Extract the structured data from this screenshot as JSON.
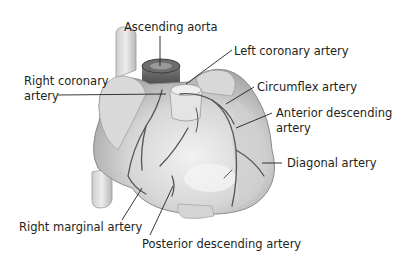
{
  "diagram": {
    "labels": {
      "ascending_aorta": "Ascending aorta",
      "left_coronary_artery": "Left coronary artery",
      "right_coronary_artery_line1": "Right coronary",
      "right_coronary_artery_line2": "artery",
      "circumflex_artery": "Circumflex artery",
      "anterior_descending_line1": "Anterior descending",
      "anterior_descending_line2": "artery",
      "diagonal_artery": "Diagonal artery",
      "right_marginal_artery": "Right marginal artery",
      "posterior_descending_artery": "Posterior descending artery"
    },
    "colors": {
      "tissue_light": "#e6e6e6",
      "tissue_mid": "#c9c9c9",
      "tissue_dark": "#8f8f8f",
      "vessel": "#5a5a5a",
      "aorta_dark": "#4a4a4a",
      "leader_line": "#231f20",
      "text": "#231f20"
    }
  }
}
